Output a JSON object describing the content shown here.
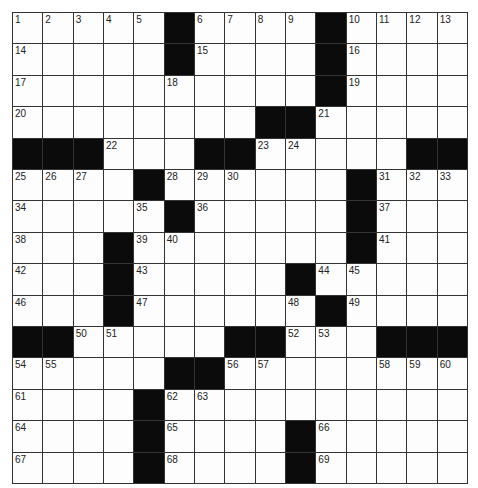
{
  "puzzle": {
    "rows": 15,
    "cols": 15,
    "colors": {
      "black_cell": "#0b0b0b",
      "white_cell": "#fdfdfd",
      "grid_line": "#333333"
    },
    "grid": [
      [
        "1",
        "2",
        "3",
        "4",
        "5",
        "#",
        "6",
        "7",
        "8",
        "9",
        "#",
        "10",
        "11",
        "12",
        "13"
      ],
      [
        "14",
        "",
        "",
        "",
        "",
        "#",
        "15",
        "",
        "",
        "",
        "#",
        "16",
        "",
        "",
        ""
      ],
      [
        "17",
        "",
        "",
        "",
        "",
        "18",
        "",
        "",
        "",
        "",
        "#",
        "19",
        "",
        "",
        ""
      ],
      [
        "20",
        "",
        "",
        "",
        "",
        "",
        "",
        "",
        "#",
        "#",
        "21",
        "",
        "",
        "",
        ""
      ],
      [
        "#",
        "#",
        "#",
        "22",
        "",
        "",
        "#",
        "#",
        "23",
        "24",
        "",
        "",
        "",
        "#",
        "#"
      ],
      [
        "25",
        "26",
        "27",
        "",
        "#",
        "28",
        "29",
        "30",
        "",
        "",
        "",
        "#",
        "31",
        "32",
        "33"
      ],
      [
        "34",
        "",
        "",
        "",
        "35",
        "#",
        "36",
        "",
        "",
        "",
        "",
        "#",
        "37",
        "",
        ""
      ],
      [
        "38",
        "",
        "",
        "#",
        "39",
        "40",
        "",
        "",
        "",
        "",
        "",
        "#",
        "41",
        "",
        ""
      ],
      [
        "42",
        "",
        "",
        "#",
        "43",
        "",
        "",
        "",
        "",
        "#",
        "44",
        "45",
        "",
        "",
        ""
      ],
      [
        "46",
        "",
        "",
        "#",
        "47",
        "",
        "",
        "",
        "",
        "48",
        "#",
        "49",
        "",
        "",
        ""
      ],
      [
        "#",
        "#",
        "50",
        "51",
        "",
        "",
        "",
        "#",
        "#",
        "52",
        "53",
        "",
        "#",
        "#",
        "#"
      ],
      [
        "54",
        "55",
        "",
        "",
        "",
        "#",
        "#",
        "56",
        "57",
        "",
        "",
        "",
        "58",
        "59",
        "60"
      ],
      [
        "61",
        "",
        "",
        "",
        "#",
        "62",
        "63",
        "",
        "",
        "",
        "",
        "",
        "",
        "",
        ""
      ],
      [
        "64",
        "",
        "",
        "",
        "#",
        "65",
        "",
        "",
        "",
        "#",
        "66",
        "",
        "",
        "",
        ""
      ],
      [
        "67",
        "",
        "",
        "",
        "#",
        "68",
        "",
        "",
        "",
        "#",
        "69",
        "",
        "",
        "",
        ""
      ]
    ]
  }
}
